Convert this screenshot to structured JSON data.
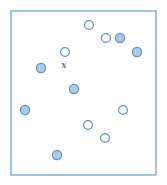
{
  "figure": {
    "width": 167,
    "height": 185,
    "background_color": "#ffffff"
  },
  "frame": {
    "name": "plot-border",
    "x": 11,
    "y": 11,
    "width": 145,
    "height": 164,
    "stroke_color": "#7ba7d7",
    "stroke_width": 1.4,
    "fill": "none"
  },
  "styles": {
    "hollow": {
      "fill": "#ffffff",
      "stroke": "#5b8fc9",
      "stroke_width": 1.2
    },
    "filled": {
      "fill": "#aacbe8",
      "stroke": "#5b8fc9",
      "stroke_width": 1.2
    },
    "label_color": "#3a3a3a"
  },
  "labels": [
    {
      "name": "query-point-label",
      "text": "x",
      "x": 64,
      "y": 68,
      "font_size": 9.5,
      "color": "#3a3a3a"
    }
  ],
  "chart_data": {
    "type": "scatter",
    "xlabel": "",
    "ylabel": "",
    "xlim": [
      11,
      156
    ],
    "ylim": [
      11,
      175
    ],
    "grid": false,
    "legend": false,
    "annotations": [
      {
        "text": "x",
        "x": 64,
        "y": 68
      }
    ],
    "series": [
      {
        "name": "hollow-points",
        "marker": "open-circle",
        "fill": "#ffffff",
        "stroke": "#5b8fc9",
        "radius": 4.4,
        "points": [
          {
            "id": "h1",
            "x": 89,
            "y": 25
          },
          {
            "id": "h2",
            "x": 106,
            "y": 38
          },
          {
            "id": "h3",
            "x": 65,
            "y": 52
          },
          {
            "id": "h4",
            "x": 123,
            "y": 110
          },
          {
            "id": "h5",
            "x": 88,
            "y": 125
          },
          {
            "id": "h6",
            "x": 105,
            "y": 138
          }
        ]
      },
      {
        "name": "filled-points",
        "marker": "filled-circle",
        "fill": "#aacbe8",
        "stroke": "#5b8fc9",
        "radius": 4.6,
        "points": [
          {
            "id": "f1",
            "x": 120,
            "y": 38
          },
          {
            "id": "f2",
            "x": 137,
            "y": 52
          },
          {
            "id": "f3",
            "x": 41,
            "y": 68
          },
          {
            "id": "f4",
            "x": 74,
            "y": 89
          },
          {
            "id": "f5",
            "x": 25,
            "y": 110
          },
          {
            "id": "f6",
            "x": 57,
            "y": 155
          }
        ]
      }
    ],
    "counts": {
      "hollow": 6,
      "filled": 6,
      "total": 12
    }
  }
}
